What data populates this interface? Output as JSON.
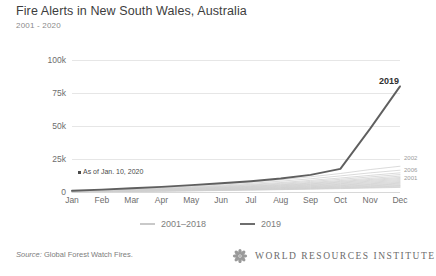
{
  "header": {
    "title": "Fire Alerts in New South Wales, Australia",
    "subtitle": "2001 - 2020"
  },
  "annotation": {
    "text": "As of Jan. 10, 2020"
  },
  "legend": {
    "items": [
      {
        "label": "2001–2018",
        "color": "#c9c9c9"
      },
      {
        "label": "2019",
        "color": "#6e6e6e"
      }
    ]
  },
  "series_end_labels": [
    {
      "label": "2002",
      "top": 155
    },
    {
      "label": "2006",
      "top": 167
    },
    {
      "label": "2001",
      "top": 175
    }
  ],
  "peak_label": "2019",
  "footer": {
    "source_prefix": "Source:",
    "source_body": " Global Forest Watch Fires.",
    "wordmark": "WORLD RESOURCES INSTITUTE"
  },
  "colors": {
    "highlight": "#5f5f5f",
    "historical": "#cfcfcf",
    "grid": "#e6e6e6",
    "text": "#4a4a4a"
  },
  "chart_data": {
    "type": "line",
    "title": "Fire Alerts in New South Wales, Australia",
    "subtitle": "2001 - 2020",
    "xlabel": "",
    "ylabel": "Number of Fire Alerts",
    "x": [
      "Jan",
      "Feb",
      "Mar",
      "Apr",
      "May",
      "Jun",
      "Jul",
      "Aug",
      "Sep",
      "Oct",
      "Nov",
      "Dec"
    ],
    "ylim": [
      0,
      100000
    ],
    "yticks": [
      0,
      25000,
      50000,
      75000,
      100000
    ],
    "ytick_labels": [
      "0",
      "25k",
      "50k",
      "75k",
      "100k"
    ],
    "grid": "horizontal",
    "legend_position": "bottom-center",
    "note": "Cumulative fire alerts by month; 2019 highlighted against 2001-2018 historical range.",
    "series": [
      {
        "name": "2019",
        "highlight": true,
        "values": [
          900,
          1800,
          2800,
          3900,
          5200,
          6600,
          8200,
          10200,
          13000,
          17500,
          48000,
          80000
        ]
      },
      {
        "name": "2002",
        "highlight": false,
        "values": [
          700,
          1500,
          2400,
          3400,
          4600,
          6000,
          7500,
          9300,
          11500,
          14000,
          17000,
          19500
        ]
      },
      {
        "name": "2006",
        "highlight": false,
        "values": [
          600,
          1300,
          2100,
          3000,
          4000,
          5200,
          6600,
          8200,
          10000,
          12200,
          14500,
          16500
        ]
      },
      {
        "name": "2001",
        "highlight": false,
        "values": [
          550,
          1150,
          1850,
          2650,
          3550,
          4600,
          5800,
          7200,
          8800,
          10600,
          12600,
          14500
        ]
      },
      {
        "name": "2003",
        "highlight": false,
        "values": [
          500,
          1050,
          1700,
          2400,
          3250,
          4200,
          5300,
          6550,
          8000,
          9600,
          11400,
          13200
        ]
      },
      {
        "name": "2004",
        "highlight": false,
        "values": [
          450,
          950,
          1550,
          2200,
          2950,
          3800,
          4800,
          5950,
          7250,
          8700,
          10300,
          12000
        ]
      },
      {
        "name": "2005",
        "highlight": false,
        "values": [
          420,
          880,
          1430,
          2030,
          2720,
          3500,
          4420,
          5480,
          6680,
          8020,
          9500,
          11000
        ]
      },
      {
        "name": "2007",
        "highlight": false,
        "values": [
          390,
          810,
          1320,
          1880,
          2520,
          3250,
          4100,
          5080,
          6200,
          7450,
          8820,
          10200
        ]
      },
      {
        "name": "2008",
        "highlight": false,
        "values": [
          360,
          750,
          1220,
          1740,
          2330,
          3000,
          3790,
          4700,
          5730,
          6880,
          8150,
          9400
        ]
      },
      {
        "name": "2009",
        "highlight": false,
        "values": [
          330,
          690,
          1120,
          1600,
          2140,
          2760,
          3490,
          4320,
          5270,
          6330,
          7500,
          8650
        ]
      },
      {
        "name": "2010",
        "highlight": false,
        "values": [
          300,
          630,
          1030,
          1460,
          1960,
          2530,
          3190,
          3960,
          4830,
          5800,
          6870,
          7920
        ]
      },
      {
        "name": "2011",
        "highlight": false,
        "values": [
          275,
          575,
          940,
          1340,
          1790,
          2310,
          2920,
          3620,
          4420,
          5300,
          6280,
          7250
        ]
      },
      {
        "name": "2012",
        "highlight": false,
        "values": [
          250,
          525,
          855,
          1220,
          1630,
          2110,
          2660,
          3300,
          4030,
          4840,
          5730,
          6610
        ]
      },
      {
        "name": "2013",
        "highlight": false,
        "values": [
          228,
          478,
          780,
          1110,
          1485,
          1920,
          2425,
          3010,
          3670,
          4410,
          5220,
          6020
        ]
      },
      {
        "name": "2014",
        "highlight": false,
        "values": [
          206,
          433,
          706,
          1006,
          1345,
          1740,
          2197,
          2726,
          3325,
          3995,
          4730,
          5455
        ]
      },
      {
        "name": "2015",
        "highlight": false,
        "values": [
          186,
          390,
          636,
          906,
          1212,
          1568,
          1979,
          2456,
          2995,
          3599,
          4261,
          4914
        ]
      },
      {
        "name": "2016",
        "highlight": false,
        "values": [
          167,
          350,
          571,
          813,
          1088,
          1407,
          1776,
          2204,
          2688,
          3230,
          3824,
          4410
        ]
      },
      {
        "name": "2017",
        "highlight": false,
        "values": [
          149,
          312,
          509,
          725,
          970,
          1254,
          1583,
          1964,
          2395,
          2878,
          3408,
          3930
        ]
      },
      {
        "name": "2018",
        "highlight": false,
        "values": [
          132,
          277,
          451,
          643,
          860,
          1112,
          1404,
          1742,
          2124,
          2552,
          3022,
          3485
        ]
      }
    ]
  }
}
